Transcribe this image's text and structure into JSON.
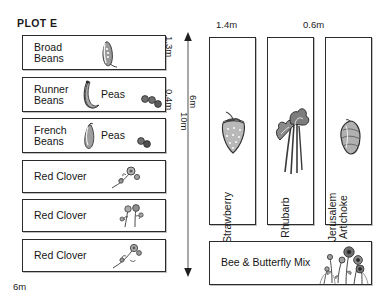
{
  "title": "PLOT E",
  "left_beds": [
    {
      "label_a": "Broad\nBeans",
      "label_b": "",
      "icon": "broad-bean-pod-icon"
    },
    {
      "label_a": "Runner\nBeans",
      "label_b": "Peas",
      "icon": "runner-bean-pod-icon"
    },
    {
      "label_a": "French\nBeans",
      "label_b": "Peas",
      "icon": "french-bean-pod-icon"
    },
    {
      "label_a": "Red Clover",
      "label_b": "",
      "icon": "clover-sprig-icon"
    },
    {
      "label_a": "Red Clover",
      "label_b": "",
      "icon": "clover-sprig-icon"
    },
    {
      "label_a": "Red Clover",
      "label_b": "",
      "icon": "clover-sprig-icon"
    }
  ],
  "right_beds": [
    {
      "label": "Strawberry",
      "icon": "strawberry-icon"
    },
    {
      "label": "Rhubarb",
      "icon": "rhubarb-icon"
    },
    {
      "label": "Jerusalem\nArtichoke",
      "icon": "jerusalem-artichoke-icon"
    }
  ],
  "bottom_bed": {
    "label": "Bee & Butterfly Mix",
    "icon": "wildflower-mix-icon"
  },
  "dimensions": {
    "bed_height_1": "1.3m",
    "bed_height_2": "0.4m",
    "plot_depth": "10m",
    "plot_width_bottom": "6m",
    "right_depth": "6m",
    "right_width_1": "1.4m",
    "right_width_2": "0.6m"
  },
  "colors": {
    "stroke": "#2b2b2b",
    "text": "#1a1a1a",
    "background": "#ffffff",
    "arrow": "#6a6a6a",
    "illustration": "#5a5a5a"
  }
}
